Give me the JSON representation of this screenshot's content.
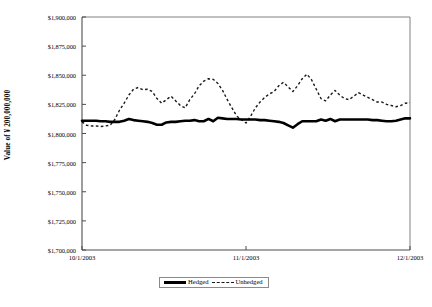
{
  "chart_data": {
    "type": "line",
    "title": "",
    "xlabel": "",
    "ylabel": "Value of ¥ 200,000,000",
    "ylim": [
      1700000,
      1900000
    ],
    "ytick_values": [
      1900000,
      1875000,
      1850000,
      1825000,
      1800000,
      1775000,
      1750000,
      1725000,
      1700000
    ],
    "ytick_labels": [
      "$1,900,000",
      "$1,875,000",
      "$1,850,000",
      "$1,825,000",
      "$1,800,000",
      "$1,775,000",
      "$1,750,000",
      "$1,725,000",
      "$1,700,000"
    ],
    "xtick_labels": [
      "10/1/2003",
      "11/1/2003",
      "12/1/2003"
    ],
    "xtick_positions": [
      0,
      0.5,
      1.0
    ],
    "grid": false,
    "legend_position": "bottom-center",
    "legend": [
      "Hedged",
      "Unhedged"
    ],
    "series": [
      {
        "name": "Hedged",
        "style": "solid",
        "color": "#000000",
        "values": [
          1811000,
          1811000,
          1811000,
          1811000,
          1810500,
          1810500,
          1810000,
          1810000,
          1810000,
          1811000,
          1812500,
          1811500,
          1811000,
          1810500,
          1810000,
          1809000,
          1807500,
          1807500,
          1809500,
          1810000,
          1810000,
          1810500,
          1811000,
          1811000,
          1811500,
          1810500,
          1810500,
          1812500,
          1810500,
          1813500,
          1813000,
          1812500,
          1812500,
          1812500,
          1812000,
          1812000,
          1812000,
          1812000,
          1811500,
          1811500,
          1811000,
          1810500,
          1810000,
          1809000,
          1807000,
          1805000,
          1808000,
          1810500,
          1810500,
          1810500,
          1810500,
          1812000,
          1811000,
          1812500,
          1810500,
          1812000,
          1812000,
          1812000,
          1812000,
          1812000,
          1812000,
          1812000,
          1811500,
          1811500,
          1811000,
          1810500,
          1810500,
          1811000,
          1812000,
          1813000,
          1813000
        ]
      },
      {
        "name": "Unhedged",
        "style": "dashed",
        "color": "#1a1a1a",
        "values": [
          1810000,
          1807000,
          1806500,
          1806500,
          1806000,
          1806500,
          1807000,
          1812000,
          1820000,
          1826000,
          1833000,
          1838000,
          1839500,
          1837500,
          1838000,
          1836000,
          1830000,
          1826000,
          1829000,
          1832000,
          1828000,
          1824000,
          1822000,
          1829000,
          1834000,
          1841000,
          1845000,
          1847000,
          1846500,
          1843000,
          1837000,
          1829000,
          1822000,
          1815000,
          1812000,
          1809000,
          1815000,
          1822000,
          1827000,
          1831000,
          1834000,
          1836000,
          1841000,
          1844000,
          1840000,
          1836000,
          1841000,
          1847000,
          1851000,
          1846000,
          1838000,
          1830000,
          1828000,
          1833000,
          1837000,
          1833000,
          1830000,
          1829000,
          1832000,
          1835000,
          1833000,
          1831000,
          1829000,
          1827000,
          1827000,
          1825000,
          1824000,
          1823000,
          1824000,
          1826000,
          1826500
        ]
      }
    ]
  },
  "axes": {
    "y_title": "Value of ¥ 200,000,000"
  },
  "legend": {
    "hedged_label": "Hedged",
    "unhedged_label": "Unhedged"
  }
}
